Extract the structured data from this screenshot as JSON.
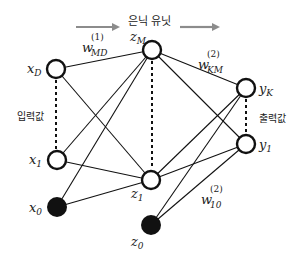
{
  "header": {
    "title": "은닉 유닛",
    "arrow_color": "#8c8c8c"
  },
  "side_labels": {
    "input": "입력값",
    "output": "출력값"
  },
  "nodes": {
    "xD": {
      "base": "x",
      "sub": "D",
      "cx": 56,
      "cy": 69,
      "filled": false
    },
    "x1": {
      "base": "x",
      "sub": "1",
      "cx": 57,
      "cy": 160,
      "filled": false
    },
    "x0": {
      "base": "x",
      "sub": "0",
      "cx": 57,
      "cy": 207,
      "filled": true
    },
    "zM": {
      "base": "z",
      "sub": "M",
      "cx": 152,
      "cy": 50,
      "filled": false
    },
    "z1": {
      "base": "z",
      "sub": "1",
      "cx": 151,
      "cy": 180,
      "filled": false
    },
    "z0": {
      "base": "z",
      "sub": "0",
      "cx": 151,
      "cy": 225,
      "filled": true
    },
    "yK": {
      "base": "y",
      "sub": "K",
      "cx": 246,
      "cy": 88,
      "filled": false
    },
    "y1": {
      "base": "y",
      "sub": "1",
      "cx": 246,
      "cy": 144,
      "filled": false
    }
  },
  "weights": {
    "w1": {
      "base": "w",
      "sup": "(1)",
      "sub": "MD"
    },
    "w2": {
      "base": "w",
      "sup": "(2)",
      "sub": "KM"
    },
    "w3": {
      "base": "w",
      "sup": "(2)",
      "sub": "10"
    }
  },
  "edges": [
    [
      "xD",
      "zM"
    ],
    [
      "xD",
      "z1"
    ],
    [
      "x1",
      "zM"
    ],
    [
      "x1",
      "z1"
    ],
    [
      "x0",
      "zM"
    ],
    [
      "x0",
      "z1"
    ],
    [
      "zM",
      "yK"
    ],
    [
      "zM",
      "y1"
    ],
    [
      "z1",
      "yK"
    ],
    [
      "z1",
      "y1"
    ],
    [
      "z0",
      "yK"
    ],
    [
      "z0",
      "y1"
    ]
  ],
  "colors": {
    "stroke": "#111111",
    "fill_bias": "#111111",
    "background": "#ffffff"
  }
}
